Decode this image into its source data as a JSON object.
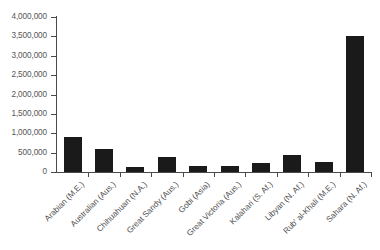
{
  "chart_data": {
    "type": "bar",
    "title": "",
    "xlabel": "",
    "ylabel": "",
    "ylim": [
      0,
      4000000
    ],
    "grid": false,
    "legend": false,
    "bar_color": "#1a1a1a",
    "axis_color": "#4a4a4a",
    "background": "#ffffff",
    "ytick_labels": [
      "4,000,000",
      "3,500,000",
      "3,000,000",
      "2,500,000",
      "2,000,000",
      "1,500,000",
      "1,000,000",
      "500,000",
      "0"
    ],
    "ytick_values": [
      4000000,
      3500000,
      3000000,
      2500000,
      2000000,
      1500000,
      1000000,
      500000,
      0
    ],
    "categories": [
      "Arabian (M.E.)",
      "Australian (Aus.)",
      "Chihuahuan (N.A.)",
      "Great Sandy (Aus.)",
      "Gobi (Asia)",
      "Great Victoria (Aus.)",
      "Kalahari (S. Af.)",
      "Libyan (N. Af.)",
      "Rub' al-Khali (M.E.)",
      "Sahara (N. Af.)"
    ],
    "values": [
      900000,
      600000,
      140000,
      400000,
      160000,
      160000,
      230000,
      430000,
      250000,
      3500000
    ]
  }
}
